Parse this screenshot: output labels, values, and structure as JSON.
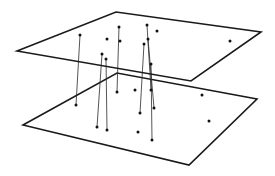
{
  "diagram": {
    "colors": {
      "stroke": "#1a1a1a",
      "link": "#2a2a2a",
      "dot": "#111111",
      "background": "#ffffff"
    },
    "planes": [
      {
        "name": "top-plane",
        "corners": [
          [
            17,
            51
          ],
          [
            116,
            12
          ],
          [
            261,
            32
          ],
          [
            191,
            81
          ]
        ]
      },
      {
        "name": "bottom-plane",
        "corners": [
          [
            23,
            125
          ],
          [
            117,
            73
          ],
          [
            257,
            99
          ],
          [
            189,
            165
          ]
        ]
      }
    ],
    "top_points": [
      [
        80,
        35
      ],
      [
        107,
        39
      ],
      [
        119,
        27
      ],
      [
        120,
        41
      ],
      [
        102,
        54
      ],
      [
        106,
        59
      ],
      [
        147,
        25
      ],
      [
        157,
        31
      ],
      [
        148,
        39
      ],
      [
        144,
        44
      ],
      [
        151,
        64
      ],
      [
        230,
        41
      ]
    ],
    "bottom_points": [
      [
        76,
        105
      ],
      [
        97,
        127
      ],
      [
        107,
        130
      ],
      [
        117,
        92
      ],
      [
        135,
        90
      ],
      [
        151,
        90
      ],
      [
        154,
        108
      ],
      [
        140,
        113
      ],
      [
        138,
        132
      ],
      [
        152,
        140
      ],
      [
        202,
        95
      ],
      [
        209,
        121
      ]
    ],
    "links": [
      [
        [
          80,
          35
        ],
        [
          76,
          105
        ]
      ],
      [
        [
          102,
          54
        ],
        [
          97,
          127
        ]
      ],
      [
        [
          106,
          59
        ],
        [
          107,
          130
        ]
      ],
      [
        [
          119,
          27
        ],
        [
          117,
          92
        ]
      ],
      [
        [
          144,
          44
        ],
        [
          140,
          113
        ]
      ],
      [
        [
          147,
          25
        ],
        [
          151,
          90
        ]
      ],
      [
        [
          148,
          39
        ],
        [
          154,
          108
        ]
      ],
      [
        [
          151,
          64
        ],
        [
          152,
          140
        ]
      ]
    ]
  }
}
